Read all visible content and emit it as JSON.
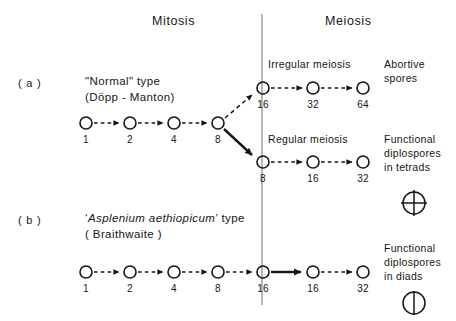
{
  "figure": {
    "background": "#ffffff",
    "ink": "#161616",
    "headers": {
      "left": "Mitosis",
      "right": "Meiosis"
    },
    "divider": {
      "label": "vertical-divider"
    },
    "rows": [
      {
        "tag": "( a )",
        "type_name_quoted": "\"Normal\" type",
        "type_author": "(Döpp - Manton)",
        "mitosis_chain": {
          "label": "mitosis-chain-a",
          "values": [
            "1",
            "2",
            "4",
            "8"
          ],
          "arrow_style": "dashed"
        },
        "branches": [
          {
            "label": "Irregular meiosis",
            "arrow_from_mitosis": "dashed",
            "chain_values": [
              "16",
              "32",
              "64"
            ],
            "chain_arrow_style": "dashed",
            "outcome": [
              "Abortive",
              "spores"
            ],
            "symbol": "none"
          },
          {
            "label": "Regular meiosis",
            "arrow_from_mitosis": "solid",
            "chain_values": [
              "8",
              "16",
              "32"
            ],
            "chain_arrow_style": "dashed",
            "outcome": [
              "Functional",
              "diplospores",
              "in tetrads"
            ],
            "symbol": "tetrad-circle-cross"
          }
        ]
      },
      {
        "tag": "( b )",
        "type_name_quoted": "'Asplenium aethiopicum' type",
        "type_name_italic_part": "Asplenium aethiopicum",
        "type_author": "( Braithwaite )",
        "mitosis_chain": {
          "label": "mitosis-chain-b",
          "values": [
            "1",
            "2",
            "4",
            "8",
            "16"
          ],
          "arrow_style": "dashed"
        },
        "branches": [
          {
            "label": "",
            "arrow_from_mitosis": "solid",
            "chain_values": [
              "16",
              "32"
            ],
            "chain_arrow_style": "dashed",
            "outcome": [
              "Functional",
              "diplospores",
              "in diads"
            ],
            "symbol": "diad-circle-line"
          }
        ]
      }
    ]
  }
}
